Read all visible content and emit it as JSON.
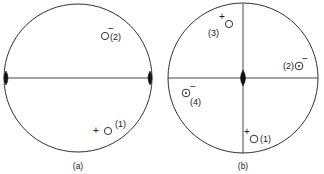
{
  "figure": {
    "type": "stereographic-projection-pair",
    "background_color": "#ffffff",
    "stroke_color": "#1a1a1a",
    "fill_color": "#111111"
  },
  "panels": [
    {
      "id": "a",
      "caption": "(a)",
      "circle": {
        "cx": 78,
        "cy": 78,
        "r": 74
      },
      "lines": [
        {
          "name": "horizontal-diameter",
          "x1": 4,
          "y1": 78,
          "x2": 152,
          "y2": 78
        }
      ],
      "poles": [
        {
          "name": "pole-left",
          "cx": 6,
          "cy": 78,
          "rx": 4,
          "ry": 7
        },
        {
          "name": "pole-right",
          "cx": 150,
          "cy": 78,
          "rx": 4,
          "ry": 7
        }
      ],
      "markers": [
        {
          "id": "a2",
          "label": "(2)",
          "sign": "−",
          "glyph": "open-circle",
          "cx": 105,
          "cy": 36,
          "r": 3.6,
          "label_x": 110,
          "label_y": 40,
          "sign_x": 111,
          "sign_y": 32
        },
        {
          "id": "a1",
          "label": "(1)",
          "sign": "+",
          "glyph": "open-circle",
          "cx": 108,
          "cy": 131,
          "r": 3.6,
          "label_x": 115,
          "label_y": 127,
          "sign_x": 96,
          "sign_y": 134
        }
      ]
    },
    {
      "id": "b",
      "caption": "(b)",
      "circle": {
        "cx": 243,
        "cy": 78,
        "r": 75
      },
      "lines": [
        {
          "name": "horizontal-diameter",
          "x1": 168,
          "y1": 78,
          "x2": 318,
          "y2": 78
        },
        {
          "name": "vertical-diameter",
          "x1": 243,
          "y1": 4,
          "x2": 243,
          "y2": 153
        }
      ],
      "poles": [
        {
          "name": "pole-center",
          "cx": 243,
          "cy": 78,
          "rx": 5,
          "ry": 8
        }
      ],
      "markers": [
        {
          "id": "b3",
          "label": "(3)",
          "sign": "+",
          "glyph": "open-circle",
          "cx": 229,
          "cy": 24,
          "r": 3.6,
          "label_x": 208,
          "label_y": 36,
          "sign_x": 222,
          "sign_y": 20
        },
        {
          "id": "b2",
          "label": "(2)",
          "sign": "−",
          "glyph": "dotted-circle",
          "cx": 299,
          "cy": 66,
          "r": 3.8,
          "label_x": 283,
          "label_y": 69,
          "sign_x": 305,
          "sign_y": 62
        },
        {
          "id": "b4",
          "label": "(4)",
          "sign": "−",
          "glyph": "dotted-circle",
          "cx": 186,
          "cy": 93,
          "r": 3.8,
          "label_x": 190,
          "label_y": 105,
          "sign_x": 193,
          "sign_y": 90
        },
        {
          "id": "b1",
          "label": "(1)",
          "sign": "+",
          "glyph": "open-circle",
          "cx": 254,
          "cy": 139,
          "r": 3.8,
          "label_x": 260,
          "label_y": 142,
          "sign_x": 247,
          "sign_y": 135
        }
      ]
    }
  ],
  "captions": {
    "panel_a": {
      "text": "(a)",
      "x": 78,
      "y": 169
    },
    "panel_b": {
      "text": "(b)",
      "x": 243,
      "y": 169
    }
  }
}
